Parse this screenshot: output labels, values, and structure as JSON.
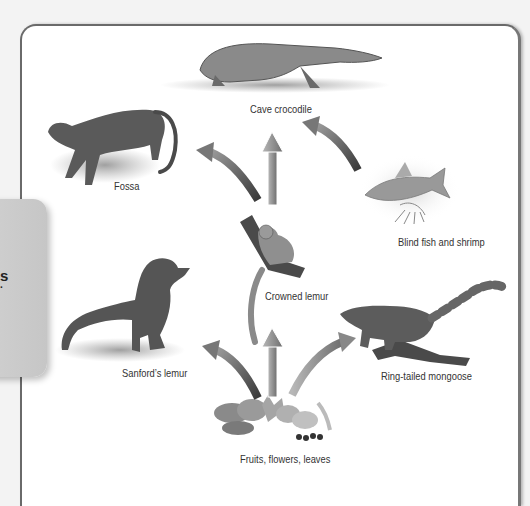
{
  "diagram": {
    "type": "food-web",
    "organisms": [
      {
        "id": "cave-crocodile",
        "label": "Cave crocodile"
      },
      {
        "id": "fossa",
        "label": "Fossa"
      },
      {
        "id": "blind-fish-shrimp",
        "label": "Blind fish and shrimp"
      },
      {
        "id": "crowned-lemur",
        "label": "Crowned lemur"
      },
      {
        "id": "sanfords-lemur",
        "label": "Sanford’s lemur"
      },
      {
        "id": "ring-tailed-mongoose",
        "label": "Ring-tailed mongoose"
      },
      {
        "id": "producers",
        "label": "Fruits, flowers, leaves"
      }
    ],
    "arrows": [
      {
        "from": "Crowned lemur",
        "to": "Cave crocodile"
      },
      {
        "from": "Crowned lemur",
        "to": "Fossa"
      },
      {
        "from": "Blind fish and shrimp",
        "to": "Cave crocodile"
      },
      {
        "from": "Fruits, flowers, leaves",
        "to": "Sanford’s lemur"
      },
      {
        "from": "Fruits, flowers, leaves",
        "to": "Crowned lemur"
      },
      {
        "from": "Fruits, flowers, leaves",
        "to": "Ring-tailed mongoose"
      }
    ]
  },
  "side_card": {
    "fragment_1": "s",
    "fragment_2": "."
  },
  "colors": {
    "background": "#f3f3f3",
    "panel": "#ffffff",
    "panel_border": "#6a6a6a",
    "side_card": "#c9c9c9",
    "label_text": "#333333"
  }
}
